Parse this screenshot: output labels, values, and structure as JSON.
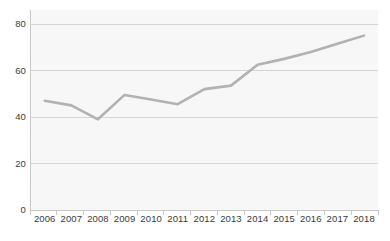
{
  "chart_data": {
    "type": "line",
    "title": "",
    "subtitle": "",
    "xlabel": "",
    "ylabel": "",
    "categories": [
      "2006",
      "2007",
      "2008",
      "2009",
      "2010",
      "2011",
      "2012",
      "2013",
      "2014",
      "2015",
      "2016",
      "2017",
      "2018"
    ],
    "values": [
      47,
      45,
      39,
      49.5,
      47.5,
      45.5,
      52,
      53.5,
      62.5,
      65,
      68,
      71.5,
      75
    ],
    "series": [
      {
        "name": "",
        "values": [
          47,
          45,
          39,
          49.5,
          47.5,
          45.5,
          52,
          53.5,
          62.5,
          65,
          68,
          71.5,
          75
        ]
      }
    ],
    "ylim": [
      0,
      80
    ],
    "y_ticks": [
      0,
      20,
      40,
      60,
      80
    ],
    "y_tick_labels": [
      "0",
      "20",
      "40",
      "60",
      "80"
    ],
    "x_tick_labels": [
      "2006",
      "2007",
      "2008",
      "2009",
      "2010",
      "2011",
      "2012",
      "2013",
      "2014",
      "2015",
      "2016",
      "2017",
      "2018"
    ],
    "grid": true,
    "grid_axis": "y",
    "legend": false,
    "legend_position": "none",
    "annotations": [],
    "markers": false,
    "colors": {
      "line": "#b2b2b2",
      "grid": "#d5d5d5",
      "plot_background": "#f7f7f7",
      "page_background": "#ffffff",
      "text": "#3a3a3a",
      "axis": "#c9c9c9"
    },
    "line_width": 2.6
  }
}
